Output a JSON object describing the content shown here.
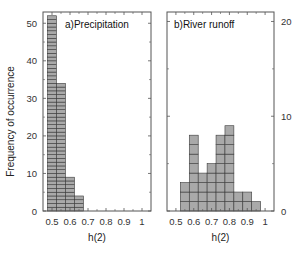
{
  "chart_data": [
    {
      "type": "bar",
      "title": "a)Precipitation",
      "xlabel": "h(2)",
      "ylabel": "Frequency of occurrence",
      "xlim": [
        0.45,
        1.05
      ],
      "ylim": [
        0,
        53
      ],
      "xticks": [
        "0.5",
        "0.6",
        "0.7",
        "0.8",
        "0.9",
        "1"
      ],
      "yticks": [
        "0",
        "10",
        "20",
        "30",
        "40",
        "50"
      ],
      "bin_width": 0.05,
      "bin_edges": [
        0.475,
        0.525,
        0.575,
        0.625,
        0.675
      ],
      "categories": [
        "0.475-0.525",
        "0.525-0.575",
        "0.575-0.625",
        "0.625-0.675"
      ],
      "values": [
        52,
        34,
        9,
        4
      ],
      "y_axis_side": "left",
      "grid": false
    },
    {
      "type": "bar",
      "title": "b)River runoff",
      "xlabel": "h(2)",
      "ylabel": "",
      "xlim": [
        0.45,
        1.05
      ],
      "ylim": [
        0,
        21
      ],
      "xticks": [
        "0.5",
        "0.6",
        "0.7",
        "0.8",
        "0.9",
        "1"
      ],
      "yticks": [
        "0",
        "10",
        "20"
      ],
      "bin_width": 0.05,
      "bin_edges": [
        0.525,
        0.575,
        0.625,
        0.675,
        0.725,
        0.775,
        0.825,
        0.875,
        0.925,
        0.975
      ],
      "categories": [
        "0.525-0.575",
        "0.575-0.625",
        "0.625-0.675",
        "0.675-0.725",
        "0.725-0.775",
        "0.775-0.825",
        "0.825-0.875",
        "0.875-0.925",
        "0.925-0.975"
      ],
      "values": [
        3,
        8,
        4,
        5,
        8,
        9,
        2,
        2,
        1
      ],
      "y_axis_side": "right",
      "grid": false
    }
  ],
  "panels": {
    "a": {
      "title": "a)Precipitation",
      "xlabel": "h(2)",
      "ylabel": "Frequency of occurrence"
    },
    "b": {
      "title": "b)River runoff",
      "xlabel": "h(2)"
    }
  },
  "colors": {
    "bar_fill": "#a9a9a9",
    "bar_stroke": "#3a3a3a",
    "axis": "#555555"
  }
}
